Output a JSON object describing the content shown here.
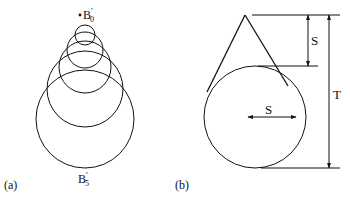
{
  "panel_a": {
    "label": "(a)",
    "top_point_label": "B",
    "top_point_prime": "′",
    "top_point_sub": "0",
    "bottom_label": "B",
    "bottom_prime": "′",
    "bottom_sub": "5",
    "circles": [
      {
        "cx": 85,
        "cy": 35,
        "r": 10
      },
      {
        "cx": 85,
        "cy": 50,
        "r": 18
      },
      {
        "cx": 85,
        "cy": 67,
        "r": 26
      },
      {
        "cx": 85,
        "cy": 87,
        "r": 36
      },
      {
        "cx": 85,
        "cy": 119,
        "r": 49
      }
    ]
  },
  "panel_b": {
    "label": "(b)",
    "s_vertical_label": "S",
    "s_horizontal_label": "S",
    "t_label": "T"
  },
  "colors": {
    "stroke": "#111111",
    "background": "#ffffff"
  }
}
